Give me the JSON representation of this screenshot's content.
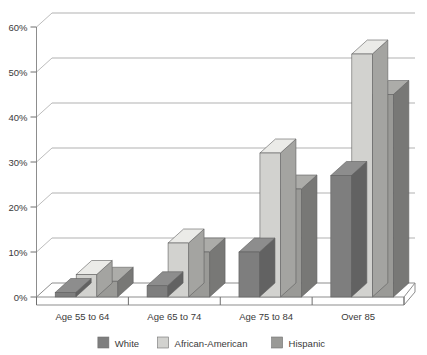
{
  "chart_data": {
    "type": "bar",
    "title": "",
    "xlabel": "",
    "ylabel": "",
    "ylim": [
      0,
      60
    ],
    "ytick_labels": [
      "0%",
      "10%",
      "20%",
      "30%",
      "40%",
      "50%",
      "60%"
    ],
    "ytick_values": [
      0,
      10,
      20,
      30,
      40,
      50,
      60
    ],
    "grid": true,
    "grid_axis": "y",
    "legend_position": "bottom",
    "three_d": true,
    "categories": [
      "Age 55 to 64",
      "Age 65 to 74",
      "Age 75 to 84",
      "Over 85"
    ],
    "series": [
      {
        "name": "White",
        "color": "#7e7e7e",
        "values": [
          1,
          2.5,
          10,
          27
        ]
      },
      {
        "name": "African-American",
        "color": "#d2d2cf",
        "values": [
          5,
          12,
          32,
          54
        ]
      },
      {
        "name": "Hispanic",
        "color": "#9a9a97",
        "values": [
          3.5,
          10,
          24,
          45
        ]
      }
    ]
  },
  "axis": {
    "y": {
      "ticks": [
        {
          "label": "60%",
          "value": 60
        },
        {
          "label": "50%",
          "value": 50
        },
        {
          "label": "40%",
          "value": 40
        },
        {
          "label": "30%",
          "value": 30
        },
        {
          "label": "20%",
          "value": 20
        },
        {
          "label": "10%",
          "value": 10
        },
        {
          "label": "0%",
          "value": 0
        }
      ]
    },
    "x": {
      "ticks": [
        {
          "label": "Age 55 to 64"
        },
        {
          "label": "Age 65 to 74"
        },
        {
          "label": "Age 75 to 84"
        },
        {
          "label": "Over 85"
        }
      ]
    }
  },
  "legend": {
    "items": [
      {
        "label": "White",
        "color": "#7e7e7e"
      },
      {
        "label": "African-American",
        "color": "#d2d2cf"
      },
      {
        "label": "Hispanic",
        "color": "#9a9a97"
      }
    ]
  }
}
